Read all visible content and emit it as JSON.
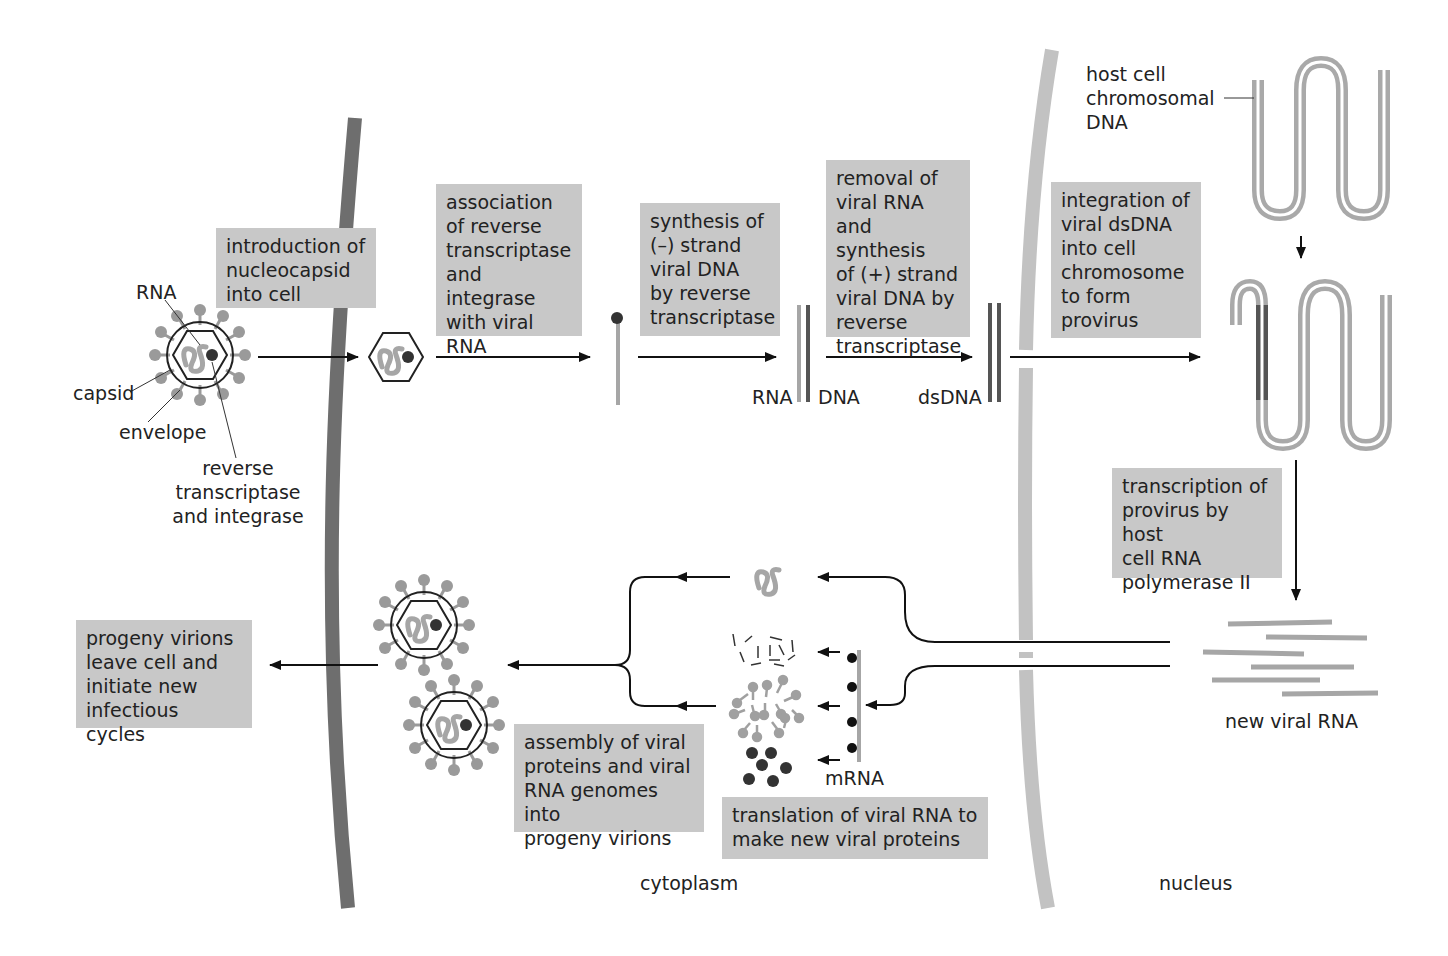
{
  "steps": {
    "introduction": "introduction of\nnucleocapsid\ninto cell",
    "association": "association\nof reverse\ntranscriptase\nand integrase\nwith viral\nRNA",
    "synthesis_minus": "synthesis of\n(–) strand\nviral DNA\nby reverse\ntranscriptase",
    "removal": "removal of\nviral RNA\nand synthesis\nof (+) strand\nviral DNA by\nreverse\ntranscriptase",
    "integration": "integration of\nviral dsDNA\ninto cell\nchromosome\nto form\nprovirus",
    "transcription": "transcription of\nprovirus by host\ncell RNA\npolymerase II",
    "translation": "translation of viral RNA to\nmake new viral proteins",
    "assembly": "assembly of viral\nproteins and viral\nRNA genomes into\nprogeny virions",
    "progeny": "progeny virions\nleave cell and\ninitiate new\ninfectious cycles"
  },
  "labels": {
    "rna": "RNA",
    "capsid": "capsid",
    "envelope": "envelope",
    "reverse_transcriptase": "reverse\ntranscriptase\nand integrase",
    "rna_strand": "RNA",
    "dna_strand": "DNA",
    "dsdna": "dsDNA",
    "host_dna": "host cell\nchromosomal\nDNA",
    "new_viral_rna": "new viral RNA",
    "mrna": "mRNA",
    "cytoplasm": "cytoplasm",
    "nucleus": "nucleus"
  },
  "colors": {
    "box_fill": "#c8c8c8",
    "plasma_membrane": "#6e6e6e",
    "nuclear_membrane": "#c2c2c2",
    "viral_rna": "#a6a6a6",
    "dna_dark": "#555555",
    "protein_dark": "#333333"
  }
}
